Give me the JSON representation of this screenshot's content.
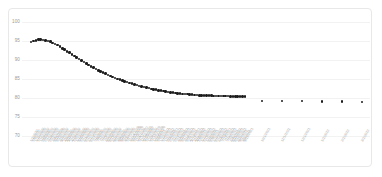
{
  "chart_data": {
    "type": "scatter",
    "title": "",
    "xlabel": "",
    "ylabel": "",
    "ylim": [
      70,
      100
    ],
    "yticks": [
      100,
      95,
      90,
      85,
      80,
      75,
      70
    ],
    "grid": true,
    "legend": false,
    "series": [
      {
        "name": "Observed",
        "marker": "filled-circle",
        "color": "#1c1c1c",
        "x": [
          "1/1/2020",
          "1/8/2020",
          "1/15/2020",
          "1/22/2020",
          "1/29/2020",
          "2/5/2020",
          "2/12/2020",
          "2/19/2020",
          "2/26/2020",
          "3/4/2020",
          "3/11/2020",
          "3/18/2020",
          "3/25/2020",
          "4/1/2020",
          "4/8/2020",
          "4/15/2020",
          "4/22/2020",
          "4/29/2020",
          "5/6/2020",
          "5/13/2020",
          "5/20/2020",
          "5/27/2020",
          "6/3/2020",
          "6/10/2020",
          "6/17/2020",
          "6/24/2020",
          "7/1/2020",
          "7/8/2020",
          "7/15/2020",
          "7/22/2020",
          "7/29/2020",
          "8/5/2020",
          "8/12/2020",
          "8/19/2020",
          "8/26/2020",
          "9/2/2020",
          "9/9/2020",
          "9/16/2020",
          "9/23/2020",
          "9/30/2020",
          "10/7/2020",
          "10/14/2020",
          "10/21/2020",
          "10/28/2020",
          "11/4/2020",
          "11/11/2020",
          "11/18/2020",
          "11/25/2020",
          "12/2/2020",
          "12/9/2020",
          "12/16/2020",
          "12/23/2020",
          "12/30/2020",
          "1/6/2021",
          "1/13/2021",
          "1/20/2021",
          "1/27/2021",
          "2/3/2021",
          "2/10/2021",
          "2/17/2021",
          "2/24/2021",
          "3/3/2021",
          "3/10/2021",
          "3/17/2021",
          "3/24/2021",
          "3/31/2021",
          "4/7/2021",
          "4/14/2021",
          "4/21/2021",
          "4/28/2021",
          "5/5/2021",
          "5/12/2021",
          "5/19/2021",
          "5/26/2021",
          "6/2/2021",
          "6/9/2021",
          "6/16/2021",
          "6/23/2021",
          "6/30/2021",
          "7/7/2021",
          "7/14/2021",
          "7/21/2021",
          "7/28/2021",
          "8/4/2021",
          "8/11/2021",
          "8/18/2021",
          "8/25/2021",
          "9/1/2021",
          "9/8/2021",
          "9/15/2021"
        ],
        "values": [
          94.7,
          95.0,
          95.2,
          95.4,
          95.4,
          95.3,
          95.2,
          95.0,
          94.8,
          94.5,
          94.2,
          93.9,
          93.5,
          93.1,
          92.7,
          92.3,
          91.9,
          91.5,
          91.1,
          90.7,
          90.3,
          89.9,
          89.5,
          89.1,
          88.7,
          88.3,
          88.0,
          87.6,
          87.3,
          87.0,
          86.7,
          86.4,
          86.1,
          85.8,
          85.5,
          85.3,
          85.0,
          84.8,
          84.6,
          84.4,
          84.2,
          84.0,
          83.8,
          83.6,
          83.4,
          83.2,
          83.0,
          82.9,
          82.7,
          82.6,
          82.4,
          82.3,
          82.2,
          82.0,
          81.9,
          81.8,
          81.7,
          81.6,
          81.5,
          81.4,
          81.3,
          81.2,
          81.2,
          81.1,
          81.0,
          81.0,
          80.9,
          80.9,
          80.8,
          80.8,
          80.7,
          80.7,
          80.7,
          80.6,
          80.6,
          80.6,
          80.5,
          80.5,
          80.5,
          80.5,
          80.5,
          80.5,
          80.5,
          80.4,
          80.4,
          80.4,
          80.4,
          80.4,
          80.4,
          80.4
        ]
      },
      {
        "name": "Projected",
        "marker": "filled-circle",
        "color": "#1c1c1c",
        "x": [
          "10/1/2021",
          "11/1/2021",
          "12/1/2021",
          "1/1/2022",
          "2/1/2022",
          "3/1/2022"
        ],
        "values": [
          79.3,
          79.2,
          79.2,
          79.1,
          79.1,
          79.0
        ]
      }
    ]
  }
}
